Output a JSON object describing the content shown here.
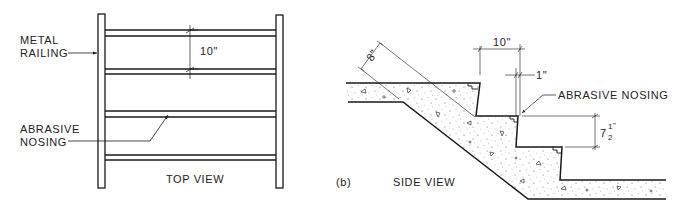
{
  "figure": {
    "panel_label": "(b)",
    "top_view": {
      "caption": "TOP VIEW",
      "labels": {
        "metal_railing_line1": "METAL",
        "metal_railing_line2": "RAILING",
        "abrasive_nosing_line1": "ABRASIVE",
        "abrasive_nosing_line2": "NOSING"
      },
      "dimensions": {
        "tread_spacing": "10\""
      }
    },
    "side_view": {
      "caption": "SIDE VIEW",
      "labels": {
        "abrasive_nosing": "ABRASIVE NOSING"
      },
      "dimensions": {
        "slab_thickness": "8\"",
        "tread_depth": "10\"",
        "nosing_overhang": "1\"",
        "riser_height_whole": "7",
        "riser_height_num": "1",
        "riser_height_den": "2",
        "riser_height_unit": "\""
      }
    },
    "colors": {
      "line": "#1a1a1a",
      "fill": "#ffffff"
    }
  }
}
